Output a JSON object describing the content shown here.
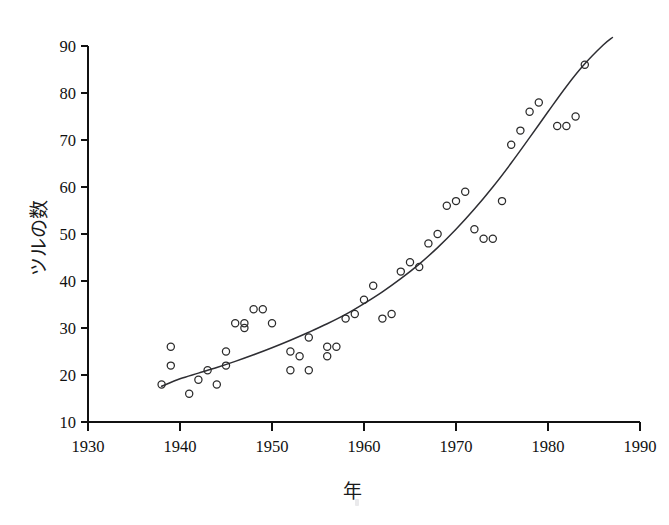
{
  "chart_data": {
    "type": "scatter",
    "title": "",
    "subtitle": "",
    "xlabel": "年",
    "ylabel": "ツルの数",
    "xlim": [
      1930,
      1990
    ],
    "ylim": [
      10,
      90
    ],
    "xticks": [
      1930,
      1940,
      1950,
      1960,
      1970,
      1980,
      1990
    ],
    "yticks": [
      10,
      20,
      30,
      40,
      50,
      60,
      70,
      80,
      90
    ],
    "grid": false,
    "legend": null,
    "marker": "open-circle",
    "x": [
      1938,
      1939,
      1939,
      1941,
      1942,
      1943,
      1944,
      1945,
      1945,
      1946,
      1947,
      1947,
      1948,
      1949,
      1950,
      1952,
      1952,
      1953,
      1954,
      1954,
      1956,
      1956,
      1957,
      1958,
      1959,
      1960,
      1961,
      1962,
      1963,
      1964,
      1965,
      1966,
      1967,
      1968,
      1969,
      1970,
      1971,
      1972,
      1973,
      1974,
      1975,
      1976,
      1977,
      1978,
      1979,
      1981,
      1982,
      1983,
      1984
    ],
    "y": [
      18,
      22,
      26,
      16,
      19,
      21,
      18,
      22,
      25,
      31,
      30,
      34,
      31,
      34,
      31,
      21,
      25,
      24,
      21,
      28,
      24,
      26,
      26,
      32,
      33,
      36,
      39,
      32,
      33,
      42,
      44,
      43,
      48,
      50,
      56,
      57,
      59,
      51,
      49,
      49,
      57,
      69,
      72,
      76,
      78,
      73,
      73,
      75,
      86
    ],
    "points": [
      {
        "x": 1938,
        "y": 18
      },
      {
        "x": 1939,
        "y": 22
      },
      {
        "x": 1939,
        "y": 26
      },
      {
        "x": 1941,
        "y": 16
      },
      {
        "x": 1942,
        "y": 19
      },
      {
        "x": 1943,
        "y": 21
      },
      {
        "x": 1944,
        "y": 18
      },
      {
        "x": 1945,
        "y": 22
      },
      {
        "x": 1945,
        "y": 25
      },
      {
        "x": 1946,
        "y": 31
      },
      {
        "x": 1947,
        "y": 30
      },
      {
        "x": 1947,
        "y": 31
      },
      {
        "x": 1948,
        "y": 34
      },
      {
        "x": 1949,
        "y": 34
      },
      {
        "x": 1950,
        "y": 31
      },
      {
        "x": 1952,
        "y": 21
      },
      {
        "x": 1952,
        "y": 25
      },
      {
        "x": 1953,
        "y": 24
      },
      {
        "x": 1954,
        "y": 21
      },
      {
        "x": 1954,
        "y": 28
      },
      {
        "x": 1956,
        "y": 24
      },
      {
        "x": 1956,
        "y": 26
      },
      {
        "x": 1957,
        "y": 26
      },
      {
        "x": 1958,
        "y": 32
      },
      {
        "x": 1959,
        "y": 33
      },
      {
        "x": 1960,
        "y": 36
      },
      {
        "x": 1961,
        "y": 39
      },
      {
        "x": 1962,
        "y": 32
      },
      {
        "x": 1963,
        "y": 33
      },
      {
        "x": 1964,
        "y": 42
      },
      {
        "x": 1965,
        "y": 44
      },
      {
        "x": 1966,
        "y": 43
      },
      {
        "x": 1967,
        "y": 48
      },
      {
        "x": 1968,
        "y": 50
      },
      {
        "x": 1969,
        "y": 56
      },
      {
        "x": 1970,
        "y": 57
      },
      {
        "x": 1971,
        "y": 59
      },
      {
        "x": 1972,
        "y": 51
      },
      {
        "x": 1973,
        "y": 49
      },
      {
        "x": 1974,
        "y": 49
      },
      {
        "x": 1975,
        "y": 57
      },
      {
        "x": 1976,
        "y": 69
      },
      {
        "x": 1977,
        "y": 72
      },
      {
        "x": 1978,
        "y": 76
      },
      {
        "x": 1979,
        "y": 78
      },
      {
        "x": 1981,
        "y": 73
      },
      {
        "x": 1982,
        "y": 73
      },
      {
        "x": 1983,
        "y": 75
      },
      {
        "x": 1984,
        "y": 86
      }
    ],
    "fit_curve": {
      "name": "exponential-trend",
      "x_start": 1938,
      "x_end": 1987,
      "points": [
        {
          "x": 1938,
          "y": 17.6
        },
        {
          "x": 1940,
          "y": 19.2
        },
        {
          "x": 1942,
          "y": 20.4
        },
        {
          "x": 1944,
          "y": 21.6
        },
        {
          "x": 1946,
          "y": 22.9
        },
        {
          "x": 1948,
          "y": 24.3
        },
        {
          "x": 1950,
          "y": 25.8
        },
        {
          "x": 1952,
          "y": 27.4
        },
        {
          "x": 1954,
          "y": 29.1
        },
        {
          "x": 1956,
          "y": 30.9
        },
        {
          "x": 1958,
          "y": 32.9
        },
        {
          "x": 1960,
          "y": 35.2
        },
        {
          "x": 1962,
          "y": 37.7
        },
        {
          "x": 1964,
          "y": 40.5
        },
        {
          "x": 1966,
          "y": 43.6
        },
        {
          "x": 1968,
          "y": 47.1
        },
        {
          "x": 1970,
          "y": 51.0
        },
        {
          "x": 1972,
          "y": 55.3
        },
        {
          "x": 1974,
          "y": 60.0
        },
        {
          "x": 1976,
          "y": 65.1
        },
        {
          "x": 1978,
          "y": 70.5
        },
        {
          "x": 1980,
          "y": 76.0
        },
        {
          "x": 1982,
          "y": 81.4
        },
        {
          "x": 1984,
          "y": 86.2
        },
        {
          "x": 1986,
          "y": 90.2
        },
        {
          "x": 1987,
          "y": 91.8
        }
      ]
    },
    "colors": {
      "axis": "#111111",
      "marker": "#2b2b2b",
      "curve": "#2e2e33",
      "background": "#ffffff"
    }
  },
  "axis": {
    "x_title": "年",
    "y_title": "ツルの数",
    "x_tick_labels": [
      "1930",
      "1940",
      "1950",
      "1960",
      "1970",
      "1980",
      "1990"
    ],
    "y_tick_labels": [
      "10",
      "20",
      "30",
      "40",
      "50",
      "60",
      "70",
      "80",
      "90"
    ]
  }
}
